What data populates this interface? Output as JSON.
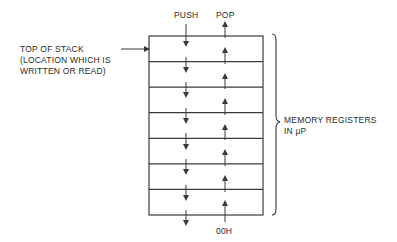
{
  "diagram": {
    "type": "stack-memory",
    "labels": {
      "push": "PUSH",
      "pop": "POP",
      "bottom_address": "00H",
      "top_of_stack": [
        "TOP OF STACK",
        "(LOCATION WHICH IS",
        "WRITTEN OR READ)"
      ],
      "registers": [
        "MEMORY REGISTERS",
        "IN μP"
      ]
    },
    "stack": {
      "rows": 7,
      "box": {
        "x": 149,
        "y": 36,
        "width": 114,
        "height": 179
      },
      "push_x": 186,
      "pop_x": 225
    },
    "colors": {
      "line": "#3a3a3a",
      "text": "#2a2a2a",
      "background": "#ffffff"
    }
  }
}
